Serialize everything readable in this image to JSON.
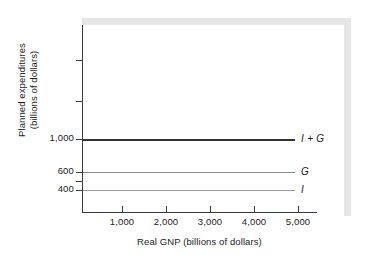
{
  "chart_data": {
    "type": "line",
    "title": "",
    "xlabel": "Real GNP (billions of dollars)",
    "ylabel": "Planned expenditures\n(billions of dollars)",
    "ylabel_line1": "Planned expenditures",
    "ylabel_line2": "(billions of dollars)",
    "x": [
      0,
      5600
    ],
    "xlim": [
      0,
      5600
    ],
    "ylim": [
      0,
      2200
    ],
    "grid": false,
    "legend_position": "right-inline",
    "xticks": [
      {
        "value": 1000,
        "label": "1,000"
      },
      {
        "value": 2000,
        "label": "2,000"
      },
      {
        "value": 3000,
        "label": "3,000"
      },
      {
        "value": 4000,
        "label": "4,000"
      },
      {
        "value": 5000,
        "label": "5,000"
      }
    ],
    "yticks": [
      {
        "value": 1800,
        "label": ""
      },
      {
        "value": 1400,
        "label": ""
      },
      {
        "value": 1000,
        "label": "1,000"
      },
      {
        "value": 600,
        "label": "600"
      },
      {
        "value": 500,
        "label": ""
      },
      {
        "value": 400,
        "label": "400"
      }
    ],
    "series": [
      {
        "name": "I + G",
        "label": "I + G",
        "value": 1000,
        "values": [
          1000,
          1000
        ],
        "color": "#333333",
        "width": 1.8
      },
      {
        "name": "G",
        "label": "G",
        "value": 600,
        "values": [
          600,
          600
        ],
        "color": "#8a8a8a",
        "width": 1.3
      },
      {
        "name": "I",
        "label": "I",
        "value": 400,
        "values": [
          400,
          400
        ],
        "color": "#9a9a9a",
        "width": 1.3
      }
    ]
  },
  "figure": {
    "background_color": "#ffffff",
    "shadow_color": "#e6e6e6",
    "axis_color": "#3a3a3a",
    "text_color": "#1a1a1a"
  }
}
